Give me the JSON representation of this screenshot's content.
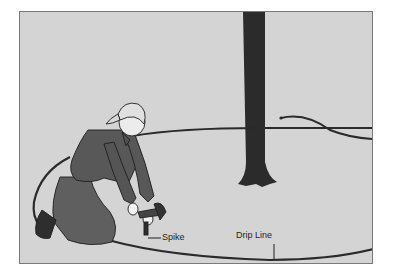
{
  "illustration": {
    "subject": "Person kneeling hammering a spike to secure a drip line hose around a tree",
    "labels": {
      "spike": "Spike",
      "drip_line": "Drip Line"
    },
    "colors": {
      "background": "#d4d4d4",
      "border": "#7a7a7a",
      "ink": "#2a2a2a",
      "tree": "#2b2b2b",
      "clothing": "#5a5a5a"
    }
  }
}
